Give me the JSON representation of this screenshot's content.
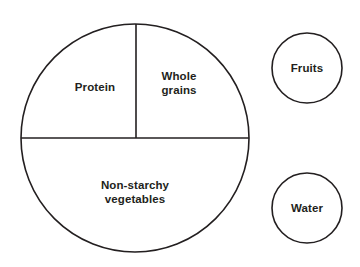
{
  "diagram": {
    "background_color": "#ffffff",
    "stroke_color": "#231f20",
    "text_color": "#231f20",
    "plate": {
      "name": "main-plate",
      "center_x": 135,
      "center_y": 138,
      "radius": 114,
      "segments": [
        {
          "id": "protein",
          "label": "Protein",
          "fraction": "one quarter",
          "position": "upper-left"
        },
        {
          "id": "whole-grains",
          "label": "Whole\ngrains",
          "fraction": "one quarter",
          "position": "upper-right"
        },
        {
          "id": "non-starchy-vegetables",
          "label": "Non-starchy\nvegetables",
          "fraction": "one half",
          "position": "bottom"
        }
      ],
      "dividers": [
        {
          "id": "horizontal-divider",
          "orientation": "horizontal"
        },
        {
          "id": "vertical-divider",
          "orientation": "vertical"
        }
      ]
    },
    "side_circles": [
      {
        "id": "fruits",
        "label": "Fruits",
        "center_x": 307,
        "center_y": 68,
        "radius": 35
      },
      {
        "id": "water",
        "label": "Water",
        "center_x": 307,
        "center_y": 208,
        "radius": 35
      }
    ]
  }
}
